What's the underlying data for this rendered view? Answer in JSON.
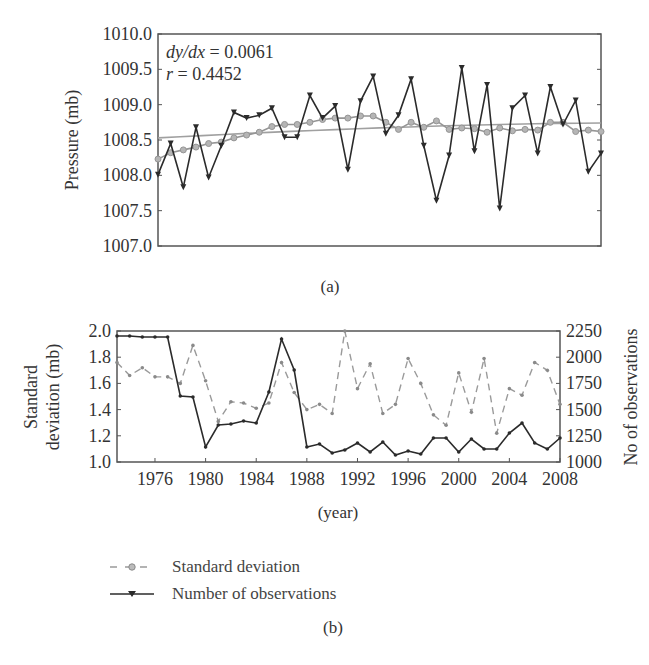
{
  "figure": {
    "panel_a": {
      "caption": "(a)",
      "annotation_slope": "dy/dx = 0.0061",
      "annotation_slope_lhs": "dy/dx",
      "annotation_slope_rhs": " = 0.0061",
      "annotation_r_lhs": "r",
      "annotation_r_rhs": " = 0.4452",
      "ylabel": "Pressure (mb)",
      "yticks": [
        "1010.0",
        "1009.5",
        "1009.0",
        "1008.5",
        "1008.0",
        "1007.5",
        "1007.0"
      ]
    },
    "panel_b": {
      "caption": "(b)",
      "xlabel": "(year)",
      "ylabel_left_line1": "Standard",
      "ylabel_left_line2": "deviation (mb)",
      "ylabel_right": "No of observations",
      "yticks_left": [
        "2.0",
        "1.8",
        "1.6",
        "1.4",
        "1.2",
        "1.0"
      ],
      "yticks_right": [
        "2250",
        "2000",
        "1750",
        "1500",
        "1250",
        "1000"
      ],
      "xticks": [
        "1976",
        "1980",
        "1984",
        "1988",
        "1992",
        "1996",
        "2000",
        "2004",
        "2008"
      ]
    },
    "legend": {
      "items": [
        {
          "label": "Standard deviation",
          "style": "dashed-circle",
          "color": "#8a8a8a"
        },
        {
          "label": "Number of observations",
          "style": "solid-triangle",
          "color": "#2b2b2b"
        }
      ]
    },
    "colors": {
      "black_series": "#2b2b2b",
      "gray_series": "#959595",
      "trend": "#a0a0a0",
      "frame": "#555555"
    }
  },
  "chart_data": [
    {
      "type": "line",
      "title": "(a)",
      "xlabel": "",
      "ylabel": "Pressure (mb)",
      "ylim": [
        1007.0,
        1010.0
      ],
      "xlim": [
        1973,
        2008
      ],
      "grid": false,
      "annotations": [
        "dy/dx = 0.0061",
        "r = 0.4452"
      ],
      "x": [
        1973,
        1974,
        1975,
        1976,
        1977,
        1978,
        1979,
        1980,
        1981,
        1982,
        1983,
        1984,
        1985,
        1986,
        1987,
        1988,
        1989,
        1990,
        1991,
        1992,
        1993,
        1994,
        1995,
        1996,
        1997,
        1998,
        1999,
        2000,
        2001,
        2002,
        2003,
        2004,
        2005,
        2006,
        2007,
        2008
      ],
      "series": [
        {
          "name": "Annual mean pressure",
          "style": "black solid, triangle markers",
          "values": [
            1008.01,
            1008.45,
            1007.83,
            1008.68,
            1007.97,
            1008.42,
            1008.89,
            1008.81,
            1008.85,
            1008.95,
            1008.54,
            1008.54,
            1009.13,
            1008.81,
            1008.98,
            1008.08,
            1009.05,
            1009.4,
            1008.59,
            1008.85,
            1009.36,
            1008.42,
            1007.64,
            1008.28,
            1009.52,
            1008.34,
            1009.28,
            1007.53,
            1008.95,
            1009.13,
            1008.31,
            1009.25,
            1008.72,
            1009.06,
            1008.05,
            1008.31
          ]
        },
        {
          "name": "Moving average",
          "style": "gray solid, circle markers",
          "values": [
            1008.23,
            1008.32,
            1008.36,
            1008.4,
            1008.45,
            1008.47,
            1008.53,
            1008.57,
            1008.61,
            1008.69,
            1008.72,
            1008.72,
            1008.75,
            1008.79,
            1008.81,
            1008.81,
            1008.84,
            1008.84,
            1008.75,
            1008.65,
            1008.75,
            1008.68,
            1008.77,
            1008.65,
            1008.67,
            1008.66,
            1008.61,
            1008.67,
            1008.63,
            1008.65,
            1008.64,
            1008.75,
            1008.75,
            1008.62,
            1008.64,
            1008.62
          ]
        },
        {
          "name": "Trend",
          "style": "gray thin solid line",
          "values_endpoints": [
            1008.53,
            1008.74
          ]
        }
      ]
    },
    {
      "type": "line",
      "title": "(b)",
      "xlabel": "(year)",
      "ylabel": "Standard deviation (mb)",
      "ylabel_right": "No of observations",
      "ylim": [
        1.0,
        2.0
      ],
      "ylim_right": [
        1000,
        2250
      ],
      "xlim": [
        1973,
        2008
      ],
      "xticks": [
        1976,
        1980,
        1984,
        1988,
        1992,
        1996,
        2000,
        2004,
        2008
      ],
      "grid": false,
      "legend_position": "below",
      "x": [
        1973,
        1974,
        1975,
        1976,
        1977,
        1978,
        1979,
        1980,
        1981,
        1982,
        1983,
        1984,
        1985,
        1986,
        1987,
        1988,
        1989,
        1990,
        1991,
        1992,
        1993,
        1994,
        1995,
        1996,
        1997,
        1998,
        1999,
        2000,
        2001,
        2002,
        2003,
        2004,
        2005,
        2006,
        2007,
        2008
      ],
      "series": [
        {
          "name": "Standard deviation",
          "axis": "left",
          "style": "gray dashed, circle markers",
          "values": [
            1.76,
            1.66,
            1.72,
            1.65,
            1.65,
            1.6,
            1.89,
            1.62,
            1.31,
            1.46,
            1.45,
            1.41,
            1.45,
            1.76,
            1.53,
            1.4,
            1.44,
            1.37,
            2.0,
            1.56,
            1.75,
            1.37,
            1.44,
            1.79,
            1.6,
            1.36,
            1.28,
            1.68,
            1.38,
            1.79,
            1.22,
            1.56,
            1.51,
            1.76,
            1.7,
            1.44
          ]
        },
        {
          "name": "Number of observations",
          "axis": "right",
          "style": "black solid, triangle markers",
          "values": [
            2202,
            2202,
            2193,
            2193,
            2193,
            1630,
            1620,
            1143,
            1353,
            1363,
            1391,
            1372,
            1668,
            2174,
            1878,
            1143,
            1172,
            1086,
            1115,
            1181,
            1095,
            1191,
            1067,
            1105,
            1076,
            1229,
            1229,
            1095,
            1219,
            1124,
            1124,
            1277,
            1372,
            1181,
            1124,
            1229
          ]
        }
      ]
    }
  ]
}
